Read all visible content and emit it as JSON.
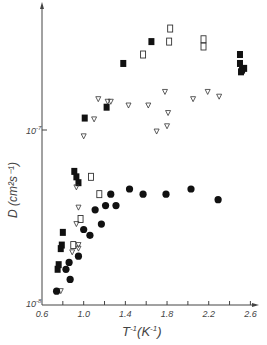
{
  "chart_data": {
    "type": "scatter",
    "title": "",
    "xlabel": "T⁻¹(K⁻¹)",
    "ylabel": "D (cm²s⁻¹)",
    "xlim": [
      0.6,
      2.7
    ],
    "ylim": [
      1e-08,
      2.7e-07
    ],
    "yscale": "log",
    "grid": false,
    "legend": "none",
    "x_ticks": [
      "0.6",
      "1.0",
      "1.4",
      "1.8",
      "2.2",
      "2.6"
    ],
    "y_ticks": [
      "10⁻⁸",
      "10⁻⁷"
    ],
    "series": [
      {
        "name": "filled-squares",
        "marker": "filled-square",
        "points": [
          [
            0.75,
            1.6e-08
          ],
          [
            0.76,
            1.7e-08
          ],
          [
            0.78,
            2.1e-08
          ],
          [
            0.79,
            2.2e-08
          ],
          [
            0.8,
            2.6e-08
          ],
          [
            0.91,
            5.8e-08
          ],
          [
            0.93,
            5.4e-08
          ],
          [
            0.95,
            5e-08
          ],
          [
            1.01,
            1.17e-07
          ],
          [
            1.22,
            1.35e-07
          ],
          [
            1.38,
            2.4e-07
          ],
          [
            1.65,
            3.2e-07
          ],
          [
            2.5,
            2.7e-07
          ],
          [
            2.5,
            2.4e-07
          ],
          [
            2.52,
            2.2e-07
          ],
          [
            2.54,
            2.25e-07
          ],
          [
            2.51,
            2.15e-07
          ]
        ]
      },
      {
        "name": "open-squares",
        "marker": "open-square",
        "points": [
          [
            1.83,
            3.8e-07
          ],
          [
            1.82,
            3.2e-07
          ],
          [
            1.57,
            2.7e-07
          ],
          [
            1.07,
            5.4e-08
          ],
          [
            1.15,
            4.3e-08
          ],
          [
            0.97,
            3.1e-08
          ],
          [
            0.9,
            2.2e-08
          ],
          [
            2.15,
            3.3e-07
          ],
          [
            2.15,
            3e-07
          ]
        ]
      },
      {
        "name": "open-triangles",
        "marker": "open-triangle",
        "points": [
          [
            0.78,
            1.2e-08
          ],
          [
            0.89,
            2e-08
          ],
          [
            0.95,
            2.1e-08
          ],
          [
            0.95,
            2.2e-08
          ],
          [
            0.93,
            4.7e-08
          ],
          [
            0.95,
            3.6e-08
          ],
          [
            1.0,
            9.2e-08
          ],
          [
            1.1,
            1.15e-07
          ],
          [
            1.14,
            1.5e-07
          ],
          [
            1.23,
            1.45e-07
          ],
          [
            1.26,
            1.45e-07
          ],
          [
            1.43,
            1.38e-07
          ],
          [
            1.62,
            1.38e-07
          ],
          [
            1.78,
            1.65e-07
          ],
          [
            1.81,
            1.25e-07
          ],
          [
            1.8,
            1.05e-07
          ],
          [
            1.7,
            9.8e-08
          ],
          [
            2.05,
            1.5e-07
          ],
          [
            2.19,
            1.65e-07
          ],
          [
            2.3,
            1.55e-07
          ],
          [
            0.93,
            2.9e-08
          ]
        ]
      },
      {
        "name": "filled-circles",
        "marker": "filled-circle",
        "points": [
          [
            0.74,
            1.2e-08
          ],
          [
            0.83,
            1.6e-08
          ],
          [
            0.86,
            1.75e-08
          ],
          [
            0.87,
            1.4e-08
          ],
          [
            0.95,
            1.9e-08
          ],
          [
            1.0,
            2.7e-08
          ],
          [
            1.06,
            2.5e-08
          ],
          [
            1.11,
            3.5e-08
          ],
          [
            1.17,
            2.9e-08
          ],
          [
            1.21,
            3.7e-08
          ],
          [
            1.26,
            4.3e-08
          ],
          [
            1.31,
            3.7e-08
          ],
          [
            1.44,
            4.6e-08
          ],
          [
            1.57,
            4.3e-08
          ],
          [
            1.79,
            4.3e-08
          ],
          [
            2.03,
            4.6e-08
          ],
          [
            2.29,
            4e-08
          ]
        ]
      }
    ]
  },
  "axes": {
    "x_label_main": "T",
    "x_label_exp": "-1",
    "x_label_unit": "(K",
    "x_label_unit_exp": "-1",
    "x_label_close": ")",
    "y_label": "D (cm²s⁻¹)",
    "y_tick_1e8": "10",
    "y_tick_1e8_exp": "-8",
    "y_tick_1e7": "10",
    "y_tick_1e7_exp": "-7",
    "colors": {
      "ink": "#111111",
      "axis": "#444444",
      "background": "#ffffff"
    }
  }
}
